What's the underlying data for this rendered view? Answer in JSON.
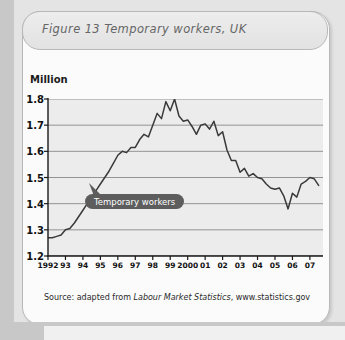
{
  "figure": {
    "title": "Figure 13  Temporary workers, UK",
    "source_prefix": "Source: adapted from ",
    "source_italic": "Labour Market Statistics",
    "source_suffix": ",  www.statistics.gov",
    "callout_label": "Temporary workers",
    "unit_label": "Million",
    "accent_callout_color": "#5d5d5d",
    "line_color": "#3a3a3a",
    "plot_bg_color": "#ececec",
    "card_bg_color": "#fbfbfb"
  },
  "chart_data": {
    "type": "line",
    "title": "Figure 13  Temporary workers, UK",
    "xlabel": "",
    "ylabel": "Million",
    "ylim": [
      1.2,
      1.8
    ],
    "ytick_labels": [
      "1.8",
      "1.7",
      "1.6",
      "1.5",
      "1.4",
      "1.3",
      "1.2"
    ],
    "ytick_values": [
      1.8,
      1.7,
      1.6,
      1.5,
      1.4,
      1.3,
      1.2
    ],
    "xtick_labels": [
      "1992",
      "93",
      "94",
      "95",
      "96",
      "97",
      "98",
      "99",
      "2000",
      "01",
      "02",
      "03",
      "04",
      "05",
      "06",
      "07"
    ],
    "xtick_values": [
      1992,
      1993,
      1994,
      1995,
      1996,
      1997,
      1998,
      1999,
      2000,
      2001,
      2002,
      2003,
      2004,
      2005,
      2006,
      2007
    ],
    "xlim": [
      1992,
      2007.75
    ],
    "grid": true,
    "legend": "none",
    "annotations": [
      {
        "text": "Temporary workers",
        "x": 1994.3,
        "y": 1.44
      }
    ],
    "series": [
      {
        "name": "Temporary workers",
        "x": [
          1992.0,
          1992.25,
          1992.5,
          1992.75,
          1993.0,
          1993.25,
          1993.5,
          1993.75,
          1994.0,
          1994.25,
          1994.5,
          1994.75,
          1995.0,
          1995.25,
          1995.5,
          1995.75,
          1996.0,
          1996.25,
          1996.5,
          1996.75,
          1997.0,
          1997.25,
          1997.5,
          1997.75,
          1998.0,
          1998.25,
          1998.5,
          1998.75,
          1999.0,
          1999.25,
          1999.5,
          1999.75,
          2000.0,
          2000.25,
          2000.5,
          2000.75,
          2001.0,
          2001.25,
          2001.5,
          2001.75,
          2002.0,
          2002.25,
          2002.5,
          2002.75,
          2003.0,
          2003.25,
          2003.5,
          2003.75,
          2004.0,
          2004.25,
          2004.5,
          2004.75,
          2005.0,
          2005.25,
          2005.5,
          2005.75,
          2006.0,
          2006.25,
          2006.5,
          2006.75,
          2007.0,
          2007.25,
          2007.5
        ],
        "values": [
          1.27,
          1.27,
          1.275,
          1.28,
          1.3,
          1.305,
          1.325,
          1.35,
          1.375,
          1.4,
          1.425,
          1.45,
          1.475,
          1.5,
          1.525,
          1.555,
          1.585,
          1.6,
          1.595,
          1.615,
          1.615,
          1.645,
          1.665,
          1.655,
          1.7,
          1.745,
          1.725,
          1.79,
          1.755,
          1.8,
          1.735,
          1.715,
          1.72,
          1.695,
          1.665,
          1.7,
          1.705,
          1.685,
          1.715,
          1.66,
          1.675,
          1.605,
          1.565,
          1.565,
          1.52,
          1.535,
          1.505,
          1.515,
          1.5,
          1.495,
          1.475,
          1.46,
          1.455,
          1.46,
          1.43,
          1.38,
          1.44,
          1.425,
          1.475,
          1.485,
          1.5,
          1.495,
          1.47
        ]
      }
    ]
  }
}
